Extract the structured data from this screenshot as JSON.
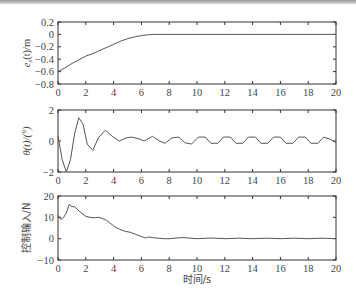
{
  "chart_data": [
    {
      "type": "line",
      "title": "",
      "xlabel": "",
      "ylabel": "e_s(t)/m",
      "xlim": [
        0,
        20
      ],
      "ylim": [
        -0.8,
        0.2
      ],
      "xticks": [
        0,
        2,
        4,
        6,
        8,
        10,
        12,
        14,
        16,
        18,
        20
      ],
      "yticks": [
        0.2,
        0,
        -0.2,
        -0.4,
        -0.6,
        -0.8
      ],
      "ytick_labels": [
        "0.2",
        "0",
        "−0.2",
        "−0.4",
        "−0.6",
        "−0.8"
      ],
      "grid": false,
      "series": [
        {
          "name": "e_s(t)",
          "x": [
            0,
            0.5,
            1,
            1.5,
            2,
            2.5,
            3,
            3.5,
            4,
            4.5,
            5,
            5.5,
            6,
            6.5,
            7,
            8,
            10,
            12,
            14,
            16,
            18,
            20
          ],
          "values": [
            -0.6,
            -0.54,
            -0.47,
            -0.41,
            -0.35,
            -0.31,
            -0.26,
            -0.21,
            -0.16,
            -0.11,
            -0.07,
            -0.04,
            -0.02,
            -0.005,
            0,
            0,
            0,
            0,
            0,
            0,
            0,
            0
          ]
        }
      ]
    },
    {
      "type": "line",
      "title": "",
      "xlabel": "",
      "ylabel": "θ(t)/(°)",
      "xlim": [
        0,
        20
      ],
      "ylim": [
        -2,
        2
      ],
      "xticks": [
        0,
        2,
        4,
        6,
        8,
        10,
        12,
        14,
        16,
        18,
        20
      ],
      "yticks": [
        2,
        0,
        -2
      ],
      "ytick_labels": [
        "2",
        "0",
        "−2"
      ],
      "grid": false,
      "series": [
        {
          "name": "θ(t)",
          "x": [
            0,
            0.3,
            0.6,
            0.9,
            1.2,
            1.5,
            1.8,
            2.1,
            2.5,
            2.9,
            3.4,
            3.9,
            4.4,
            4.9,
            5.3,
            5.8,
            6.2,
            6.8,
            7.3,
            7.7,
            8.2,
            8.7,
            9.1,
            9.6,
            10.1,
            10.6,
            11.0,
            11.5,
            11.9,
            12.4,
            12.8,
            13.3,
            13.7,
            14.2,
            14.6,
            15.1,
            15.5,
            16.0,
            16.4,
            16.9,
            17.3,
            17.8,
            18.2,
            18.7,
            19.1,
            19.6,
            20.0
          ],
          "values": [
            0.3,
            -1.2,
            -2.0,
            -1.2,
            0.5,
            1.5,
            1.1,
            -0.2,
            -0.6,
            0.2,
            0.7,
            0.3,
            0.0,
            0.2,
            0.25,
            0.15,
            0.0,
            0.3,
            0.0,
            -0.15,
            0.2,
            0.25,
            -0.1,
            -0.2,
            0.25,
            0.25,
            -0.15,
            -0.15,
            0.25,
            0.25,
            -0.15,
            -0.15,
            0.25,
            0.25,
            -0.15,
            -0.15,
            0.25,
            0.25,
            -0.15,
            -0.15,
            0.25,
            0.25,
            -0.15,
            -0.15,
            0.25,
            0.1,
            -0.1
          ]
        }
      ]
    },
    {
      "type": "line",
      "title": "",
      "xlabel": "时间/s",
      "ylabel": "控制输入/N",
      "xlim": [
        0,
        20
      ],
      "ylim": [
        -10,
        20
      ],
      "xticks": [
        0,
        2,
        4,
        6,
        8,
        10,
        12,
        14,
        16,
        18,
        20
      ],
      "yticks": [
        20,
        10,
        0,
        -10
      ],
      "ytick_labels": [
        "20",
        "10",
        "0",
        "−10"
      ],
      "grid": false,
      "series": [
        {
          "name": "控制输入",
          "x": [
            0,
            0.2,
            0.4,
            0.6,
            0.8,
            1.0,
            1.2,
            1.5,
            1.8,
            2.0,
            2.3,
            2.6,
            2.9,
            3.2,
            3.5,
            3.8,
            4.1,
            4.4,
            4.8,
            5.2,
            5.6,
            6.0,
            6.3,
            6.5,
            6.8,
            7.2,
            7.6,
            8.0,
            8.5,
            9.0,
            10,
            11,
            12,
            13,
            14,
            15,
            16,
            17,
            18,
            19,
            20
          ],
          "values": [
            11,
            9,
            10,
            12,
            16,
            15,
            15,
            13,
            11.5,
            10.5,
            10,
            9.8,
            10,
            9.5,
            8.5,
            7,
            5.5,
            4.5,
            3.5,
            3,
            2,
            1,
            0.3,
            0.8,
            0.5,
            0.2,
            0,
            0,
            0.3,
            0.5,
            0,
            0.3,
            0,
            0.2,
            0,
            0.2,
            0,
            0.2,
            0,
            0.2,
            0
          ]
        }
      ]
    }
  ],
  "plots": [
    {
      "ylabel_main": "e",
      "ylabel_sub": "s",
      "ylabel_rest": "(t)/m",
      "yticks": [
        "0.2",
        "0",
        "−0.2",
        "−0.4",
        "−0.6",
        "−0.8"
      ],
      "xticks": [
        "0",
        "2",
        "4",
        "6",
        "8",
        "10",
        "12",
        "14",
        "16",
        "18",
        "20"
      ]
    },
    {
      "ylabel": "θ(t)/(°)",
      "yticks": [
        "2",
        "0",
        "−2"
      ],
      "xticks": [
        "0",
        "2",
        "4",
        "6",
        "8",
        "10",
        "12",
        "14",
        "16",
        "18",
        "20"
      ]
    },
    {
      "ylabel": "控制输入/N",
      "yticks": [
        "20",
        "10",
        "0",
        "−10"
      ],
      "xticks": [
        "0",
        "2",
        "4",
        "6",
        "8",
        "10",
        "12",
        "14",
        "16",
        "18",
        "20"
      ]
    }
  ],
  "xlabel": "时间/s",
  "colors": {
    "line": "#555555",
    "axis": "#333333",
    "header_bar": "#a0a0a0"
  }
}
